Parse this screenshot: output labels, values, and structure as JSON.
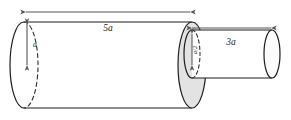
{
  "figure": {
    "type": "geometry-diagram",
    "background_color": "#ffffff",
    "stroke_color": "#1d1d1d",
    "dimension_line_color": "#555555",
    "face_fill_color": "#e3e3e3",
    "body_fill_color": "#ffffff"
  },
  "labels": {
    "big_cylinder_length": "5a",
    "big_cylinder_diameter": "a",
    "small_cylinder_length": "3a",
    "small_cylinder_diameter": "a/2"
  },
  "shapes": {
    "big_cylinder": {
      "name": "large-cylinder",
      "length_label": "5a",
      "diameter_label": "a",
      "left_cap_cx": 24,
      "left_cap_cy": 65,
      "right_cap_cx": 192,
      "rx": 14,
      "ry": 43
    },
    "small_cylinder": {
      "name": "small-cylinder",
      "length_label": "3a",
      "diameter_label": "a/2",
      "left_cap_cx": 192,
      "left_cap_cy": 54,
      "right_cap_cx": 272,
      "rx": 8,
      "ry": 24
    }
  },
  "dimensions": [
    {
      "name": "length-5a",
      "label": "5a",
      "orientation": "horizontal",
      "arrowheads": "both",
      "x1": 25,
      "x2": 191,
      "y": 12
    },
    {
      "name": "diameter-a",
      "label": "a",
      "orientation": "vertical",
      "arrowheads": "both",
      "x": 27,
      "y1": 23,
      "y2": 66
    },
    {
      "name": "length-3a",
      "label": "3a",
      "orientation": "horizontal",
      "arrowheads": "both",
      "x1": 191,
      "x2": 272,
      "y": 28
    },
    {
      "name": "diameter-a-half",
      "label": "a/2",
      "orientation": "vertical",
      "arrowheads": "both",
      "x": 192,
      "y1": 33,
      "y2": 66
    }
  ]
}
